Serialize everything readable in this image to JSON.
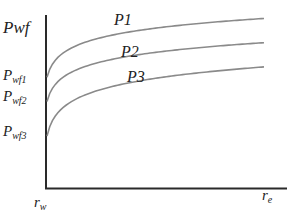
{
  "chart_data": {
    "type": "line",
    "title": "",
    "xlabel": "",
    "ylabel": "Pwf",
    "x_tick_labels": {
      "start": "r",
      "start_sub": "w",
      "end": "r",
      "end_sub": "e"
    },
    "y_tick_labels": [
      {
        "main": "P",
        "sub": "wf1",
        "value": 0.64
      },
      {
        "main": "P",
        "sub": "wf2",
        "value": 0.5
      },
      {
        "main": "P",
        "sub": "wf3",
        "value": 0.3
      }
    ],
    "xlim": [
      1,
      100
    ],
    "ylim": [
      0,
      1
    ],
    "x_scale": "log-like (radial distance from wellbore rw to drainage radius re)",
    "grid": false,
    "legend": "inline labels above each curve",
    "series": [
      {
        "name": "P1",
        "start_value": 0.64,
        "end_value": 0.98,
        "shape": "logarithmic rise"
      },
      {
        "name": "P2",
        "start_value": 0.5,
        "end_value": 0.84,
        "shape": "logarithmic rise"
      },
      {
        "name": "P3",
        "start_value": 0.3,
        "end_value": 0.7,
        "shape": "logarithmic rise"
      }
    ],
    "colors": {
      "axis": "#2a2a2a",
      "curve": "#8a8a8a",
      "text": "#222222"
    }
  }
}
